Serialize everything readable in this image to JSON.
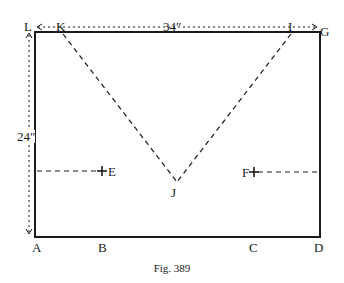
{
  "figure": {
    "caption": "Fig. 389",
    "dimensions": {
      "width_label": "34″",
      "height_label": "24″"
    },
    "points": {
      "L": "L",
      "K": "K",
      "I": "I",
      "G": "G",
      "A": "A",
      "B": "B",
      "C": "C",
      "D": "D",
      "E": "E",
      "F": "F",
      "J": "J"
    },
    "colors": {
      "ink": "#1a1a1a",
      "background": "#ffffff"
    }
  }
}
